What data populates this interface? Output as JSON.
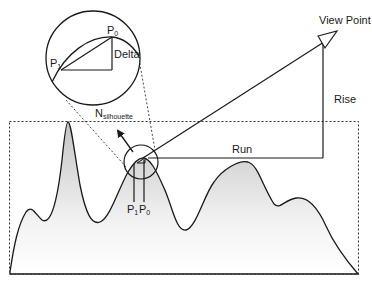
{
  "diagram": {
    "type": "line-of-sight silhouette diagram",
    "labels": {
      "view_point": "View Point",
      "rise": "Rise",
      "run": "Run",
      "delta": "Delta",
      "p0_main": "P",
      "p0_sub": "0",
      "p1_main": "P",
      "p1_sub": "1",
      "n_main": "N",
      "n_sub": "silhouette"
    },
    "colors": {
      "stroke": "#1a1a1a",
      "terrain_fill_top": "#c8c8c8",
      "terrain_fill_bottom": "#ffffff",
      "background": "#ffffff"
    },
    "elements": [
      "terrain profile with gradient fill",
      "dashed bounding rectangle",
      "magnified inset circle showing P0, P1 and Delta",
      "small circle at terrain peak with dashed zoom lines",
      "sight line from peak to View Point",
      "Rise (vertical) and Run (horizontal) legs",
      "silhouette normal arrow",
      "View Point triangle marker"
    ]
  }
}
